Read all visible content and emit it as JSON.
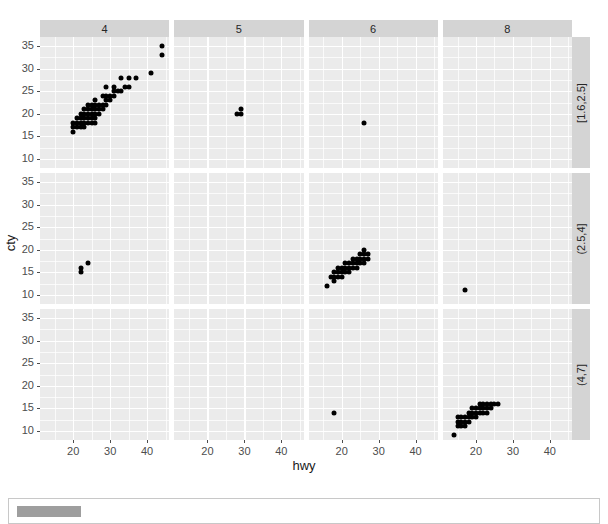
{
  "chart_data": {
    "type": "scatter",
    "title": "",
    "xlabel": "hwy",
    "ylabel": "cty",
    "xlim": [
      11,
      46
    ],
    "ylim": [
      8,
      37
    ],
    "xticks": [
      20,
      30,
      40
    ],
    "yticks": [
      10,
      15,
      20,
      25,
      30,
      35
    ],
    "grid": true,
    "legend": "none",
    "facet_col_var": "cyl",
    "facet_row_var": "displ",
    "facet_cols": [
      "4",
      "5",
      "6",
      "8"
    ],
    "facet_rows": [
      "[1.6,2.5]",
      "(2.5,4]",
      "(4,7]"
    ],
    "point_color": "#000000",
    "panel_bg": "#ebebeb",
    "grid_color": "#ffffff",
    "strip_bg": "#d4d4d4",
    "panels": [
      {
        "col": "4",
        "row": "[1.6,2.5]",
        "points": [
          [
            44,
            35
          ],
          [
            44,
            33
          ],
          [
            41,
            29
          ],
          [
            37,
            28
          ],
          [
            35,
            28
          ],
          [
            33,
            28
          ],
          [
            35,
            26
          ],
          [
            34,
            26
          ],
          [
            32,
            25
          ],
          [
            33,
            25
          ],
          [
            31,
            24
          ],
          [
            31,
            25
          ],
          [
            30,
            24
          ],
          [
            30,
            23
          ],
          [
            29,
            24
          ],
          [
            29,
            23
          ],
          [
            29,
            22
          ],
          [
            28,
            22
          ],
          [
            28,
            21
          ],
          [
            27,
            22
          ],
          [
            27,
            21
          ],
          [
            27,
            20
          ],
          [
            26,
            21
          ],
          [
            26,
            20
          ],
          [
            26,
            19
          ],
          [
            26,
            18
          ],
          [
            25,
            21
          ],
          [
            25,
            20
          ],
          [
            25,
            19
          ],
          [
            25,
            18
          ],
          [
            24,
            20
          ],
          [
            24,
            19
          ],
          [
            24,
            18
          ],
          [
            23,
            20
          ],
          [
            23,
            19
          ],
          [
            23,
            18
          ],
          [
            23,
            17
          ],
          [
            22,
            19
          ],
          [
            22,
            18
          ],
          [
            22,
            17
          ],
          [
            21,
            18
          ],
          [
            21,
            17
          ],
          [
            20,
            18
          ],
          [
            20,
            17
          ],
          [
            29,
            26
          ],
          [
            28,
            24
          ],
          [
            31,
            26
          ],
          [
            26,
            23
          ],
          [
            24,
            21
          ],
          [
            26,
            22
          ],
          [
            25,
            22
          ],
          [
            24,
            22
          ],
          [
            23,
            21
          ],
          [
            22,
            20
          ],
          [
            21,
            19
          ],
          [
            20,
            16
          ]
        ]
      },
      {
        "col": "5",
        "row": "[1.6,2.5]",
        "points": [
          [
            29,
            21
          ],
          [
            28,
            20
          ],
          [
            29,
            20
          ]
        ]
      },
      {
        "col": "6",
        "row": "[1.6,2.5]",
        "points": [
          [
            26,
            18
          ]
        ]
      },
      {
        "col": "8",
        "row": "[1.6,2.5]",
        "points": []
      },
      {
        "col": "4",
        "row": "(2.5,4]",
        "points": [
          [
            22,
            16
          ],
          [
            22,
            15
          ],
          [
            24,
            17
          ]
        ]
      },
      {
        "col": "5",
        "row": "(2.5,4]",
        "points": []
      },
      {
        "col": "6",
        "row": "(2.5,4]",
        "points": [
          [
            17,
            14
          ],
          [
            18,
            14
          ],
          [
            18,
            15
          ],
          [
            19,
            15
          ],
          [
            19,
            16
          ],
          [
            20,
            15
          ],
          [
            20,
            16
          ],
          [
            21,
            16
          ],
          [
            21,
            17
          ],
          [
            22,
            16
          ],
          [
            22,
            17
          ],
          [
            23,
            17
          ],
          [
            23,
            18
          ],
          [
            24,
            17
          ],
          [
            24,
            18
          ],
          [
            25,
            18
          ],
          [
            25,
            19
          ],
          [
            26,
            18
          ],
          [
            26,
            19
          ],
          [
            27,
            19
          ],
          [
            27,
            18
          ],
          [
            26,
            17
          ],
          [
            24,
            16
          ],
          [
            22,
            15
          ],
          [
            20,
            14
          ],
          [
            19,
            14
          ],
          [
            18,
            13
          ],
          [
            26,
            20
          ],
          [
            25,
            17
          ],
          [
            23,
            16
          ],
          [
            21,
            15
          ],
          [
            16,
            12
          ]
        ]
      },
      {
        "col": "8",
        "row": "(2.5,4]",
        "points": [
          [
            17,
            11
          ]
        ]
      },
      {
        "col": "4",
        "row": "(4,7]",
        "points": []
      },
      {
        "col": "5",
        "row": "(4,7]",
        "points": []
      },
      {
        "col": "6",
        "row": "(4,7]",
        "points": [
          [
            18,
            14
          ]
        ]
      },
      {
        "col": "8",
        "row": "(4,7]",
        "points": [
          [
            14,
            9
          ],
          [
            15,
            11
          ],
          [
            15,
            12
          ],
          [
            16,
            12
          ],
          [
            16,
            13
          ],
          [
            17,
            12
          ],
          [
            17,
            13
          ],
          [
            18,
            13
          ],
          [
            18,
            14
          ],
          [
            19,
            13
          ],
          [
            19,
            14
          ],
          [
            20,
            14
          ],
          [
            20,
            15
          ],
          [
            21,
            14
          ],
          [
            21,
            15
          ],
          [
            22,
            15
          ],
          [
            22,
            16
          ],
          [
            23,
            15
          ],
          [
            23,
            16
          ],
          [
            24,
            16
          ],
          [
            25,
            16
          ],
          [
            26,
            16
          ],
          [
            24,
            15
          ],
          [
            22,
            14
          ],
          [
            20,
            13
          ],
          [
            18,
            12
          ],
          [
            17,
            11
          ],
          [
            16,
            11
          ],
          [
            15,
            13
          ],
          [
            19,
            15
          ],
          [
            21,
            16
          ],
          [
            23,
            14
          ]
        ]
      }
    ]
  },
  "caption": {
    "label": "",
    "text": ""
  }
}
